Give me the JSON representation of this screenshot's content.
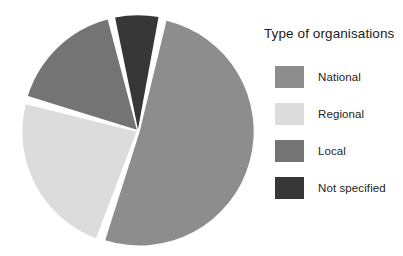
{
  "legend": {
    "title": "Type of organisations",
    "position": "right",
    "items": [
      {
        "label": "National",
        "color": "#8d8d8d"
      },
      {
        "label": "Regional",
        "color": "#dcdcdc"
      },
      {
        "label": "Local",
        "color": "#747474"
      },
      {
        "label": "Not specified",
        "color": "#373737"
      }
    ]
  },
  "chart_data": {
    "type": "pie",
    "title": "Type of organisations",
    "xlabel": "",
    "ylabel": "",
    "legend_position": "right",
    "grid": false,
    "exploded": true,
    "start_angle_deg": 12,
    "direction": "clockwise",
    "categories": [
      "National",
      "Regional",
      "Local",
      "Not specified"
    ],
    "values": [
      52,
      24,
      17,
      7
    ],
    "unit": "%",
    "colors": [
      "#8d8d8d",
      "#dcdcdc",
      "#747474",
      "#373737"
    ],
    "slices": [
      {
        "label": "National",
        "value": 52,
        "angle_deg": 187.2,
        "start_deg": 12.0,
        "end_deg": 199.2,
        "color": "#8d8d8d"
      },
      {
        "label": "Regional",
        "value": 24,
        "angle_deg": 86.4,
        "start_deg": 199.2,
        "end_deg": 285.6,
        "color": "#dcdcdc"
      },
      {
        "label": "Local",
        "value": 17,
        "angle_deg": 61.2,
        "start_deg": 285.6,
        "end_deg": 346.8,
        "color": "#747474"
      },
      {
        "label": "Not specified",
        "value": 7,
        "angle_deg": 25.2,
        "start_deg": 346.8,
        "end_deg": 372.0,
        "color": "#373737"
      }
    ]
  },
  "geometry": {
    "cx": 138,
    "cy": 131,
    "radius": 114,
    "gap_px": 3.2
  }
}
